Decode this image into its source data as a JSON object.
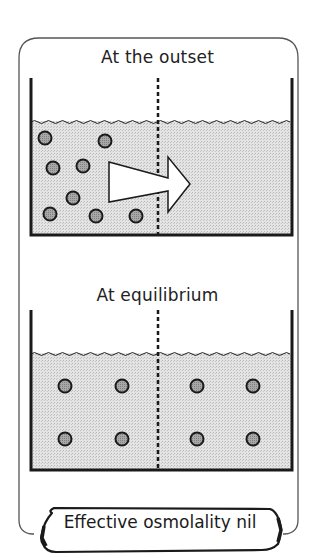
{
  "panels": [
    {
      "title": "At the outset",
      "particles_left": [
        [
          45,
          138
        ],
        [
          105,
          141
        ],
        [
          53,
          168
        ],
        [
          83,
          166
        ],
        [
          73,
          198
        ],
        [
          50,
          214
        ],
        [
          96,
          216
        ],
        [
          136,
          216
        ]
      ],
      "particles_right": [],
      "arrow": {
        "direction": "right",
        "label": ""
      }
    },
    {
      "title": "At equilibrium",
      "particles_left": [
        [
          65,
          386
        ],
        [
          122,
          386
        ],
        [
          65,
          439
        ],
        [
          122,
          439
        ]
      ],
      "particles_right": [
        [
          197,
          386
        ],
        [
          253,
          386
        ],
        [
          197,
          439
        ],
        [
          253,
          439
        ]
      ]
    }
  ],
  "footer": {
    "label": "Effective osmolality nil"
  },
  "colors": {
    "ink": "#1a1a1a",
    "frame": "#555555",
    "water": "#d9d9d9",
    "particle": "#9a9a9a"
  }
}
